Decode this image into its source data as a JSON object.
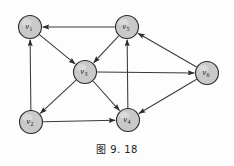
{
  "figure": {
    "caption": "图 9. 18",
    "background_color": "#fdfdfd",
    "node_fill_color": "#c9c9c9",
    "node_stroke_color": "#2b2b2b",
    "edge_color": "#3a3a3a"
  },
  "chart_data": {
    "type": "diagram",
    "diagram_kind": "directed-graph",
    "title": "图 9. 18",
    "xlabel": "",
    "ylabel": "",
    "grid": false,
    "legend": null,
    "node_radius": 11.5,
    "nodes": [
      {
        "id": "v1",
        "label": "v",
        "subscript": "1",
        "x": 30,
        "y": 27
      },
      {
        "id": "v5",
        "label": "v",
        "subscript": "5",
        "x": 127,
        "y": 27
      },
      {
        "id": "v3",
        "label": "v",
        "subscript": "3",
        "x": 85,
        "y": 72
      },
      {
        "id": "v6",
        "label": "v",
        "subscript": "6",
        "x": 207,
        "y": 73
      },
      {
        "id": "v2",
        "label": "v",
        "subscript": "2",
        "x": 31,
        "y": 122
      },
      {
        "id": "v4",
        "label": "v",
        "subscript": "4",
        "x": 128,
        "y": 120
      }
    ],
    "edges": [
      {
        "from": "v5",
        "to": "v1",
        "directed": true
      },
      {
        "from": "v2",
        "to": "v1",
        "directed": true
      },
      {
        "from": "v1",
        "to": "v3",
        "directed": true
      },
      {
        "from": "v5",
        "to": "v3",
        "directed": true
      },
      {
        "from": "v3",
        "to": "v2",
        "directed": true
      },
      {
        "from": "v3",
        "to": "v4",
        "directed": true
      },
      {
        "from": "v3",
        "to": "v6",
        "directed": true
      },
      {
        "from": "v2",
        "to": "v4",
        "directed": true
      },
      {
        "from": "v4",
        "to": "v5",
        "directed": true
      },
      {
        "from": "v6",
        "to": "v5",
        "directed": true
      },
      {
        "from": "v6",
        "to": "v4",
        "directed": true
      }
    ]
  }
}
